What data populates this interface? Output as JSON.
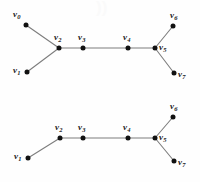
{
  "figure": {
    "background_color": "#fefefe",
    "edge_color": "#7d7d7d",
    "node_color": "#111111",
    "label_color": "#1a1a1a",
    "watermark_text": "))"
  },
  "graphs": [
    {
      "id": "top-graph",
      "name": "graph-top",
      "nodes": [
        {
          "id": "v0",
          "label": "v",
          "sub": "0",
          "x": 26,
          "y": 25,
          "label_x": 13,
          "label_y": 10,
          "label_pos": "left-above"
        },
        {
          "id": "v1",
          "label": "v",
          "sub": "1",
          "x": 27,
          "y": 72,
          "label_x": 13,
          "label_y": 66,
          "label_pos": "left-below"
        },
        {
          "id": "v2",
          "label": "v",
          "sub": "2",
          "x": 59,
          "y": 48,
          "label_x": 54,
          "label_y": 33,
          "label_pos": "above"
        },
        {
          "id": "v3",
          "label": "v",
          "sub": "3",
          "x": 83,
          "y": 48,
          "label_x": 78,
          "label_y": 33,
          "label_pos": "above"
        },
        {
          "id": "v4",
          "label": "v",
          "sub": "4",
          "x": 128,
          "y": 48,
          "label_x": 123,
          "label_y": 33,
          "label_pos": "above"
        },
        {
          "id": "v5",
          "label": "v",
          "sub": "5",
          "x": 155,
          "y": 48,
          "label_x": 159,
          "label_y": 43,
          "label_pos": "right"
        },
        {
          "id": "v6",
          "label": "v",
          "sub": "6",
          "x": 173,
          "y": 26,
          "label_x": 170,
          "label_y": 11,
          "label_pos": "above"
        },
        {
          "id": "v7",
          "label": "v",
          "sub": "7",
          "x": 174,
          "y": 73,
          "label_x": 178,
          "label_y": 70,
          "label_pos": "right-below"
        }
      ],
      "edges": [
        {
          "from": "v0",
          "to": "v2"
        },
        {
          "from": "v1",
          "to": "v2"
        },
        {
          "from": "v2",
          "to": "v3"
        },
        {
          "from": "v3",
          "to": "v4"
        },
        {
          "from": "v4",
          "to": "v5"
        },
        {
          "from": "v5",
          "to": "v6"
        },
        {
          "from": "v5",
          "to": "v7"
        }
      ]
    },
    {
      "id": "bottom-graph",
      "name": "graph-bottom",
      "nodes": [
        {
          "id": "v1",
          "label": "v",
          "sub": "1",
          "x": 28,
          "y": 158,
          "label_x": 14,
          "label_y": 152,
          "label_pos": "left-below"
        },
        {
          "id": "v2",
          "label": "v",
          "sub": "2",
          "x": 60,
          "y": 138,
          "label_x": 55,
          "label_y": 123,
          "label_pos": "above"
        },
        {
          "id": "v3",
          "label": "v",
          "sub": "3",
          "x": 83,
          "y": 138,
          "label_x": 78,
          "label_y": 123,
          "label_pos": "above"
        },
        {
          "id": "v4",
          "label": "v",
          "sub": "4",
          "x": 128,
          "y": 138,
          "label_x": 123,
          "label_y": 123,
          "label_pos": "above"
        },
        {
          "id": "v5",
          "label": "v",
          "sub": "5",
          "x": 155,
          "y": 138,
          "label_x": 159,
          "label_y": 133,
          "label_pos": "right"
        },
        {
          "id": "v6",
          "label": "v",
          "sub": "6",
          "x": 173,
          "y": 117,
          "label_x": 170,
          "label_y": 102,
          "label_pos": "above"
        },
        {
          "id": "v7",
          "label": "v",
          "sub": "7",
          "x": 174,
          "y": 161,
          "label_x": 178,
          "label_y": 158,
          "label_pos": "right-below"
        }
      ],
      "edges": [
        {
          "from": "v1",
          "to": "v2"
        },
        {
          "from": "v2",
          "to": "v3"
        },
        {
          "from": "v3",
          "to": "v4"
        },
        {
          "from": "v4",
          "to": "v5"
        },
        {
          "from": "v5",
          "to": "v6"
        },
        {
          "from": "v5",
          "to": "v7"
        }
      ]
    }
  ]
}
